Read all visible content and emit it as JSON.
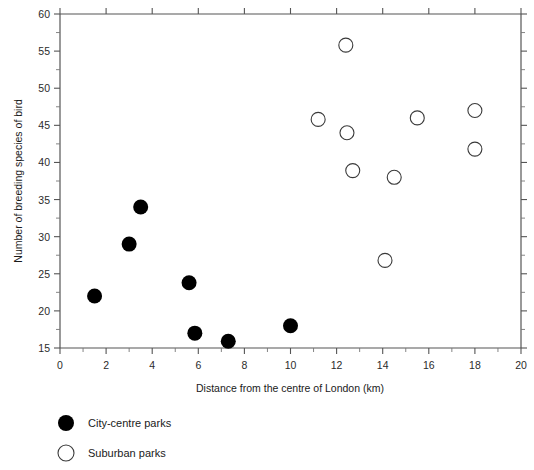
{
  "chart_data": {
    "type": "scatter",
    "title": "",
    "xlabel": "Distance from the centre of London (km)",
    "ylabel": "Number of breeding species of bird",
    "xlim": [
      0,
      20
    ],
    "ylim": [
      15,
      60
    ],
    "x_major_ticks": [
      0,
      2,
      4,
      6,
      8,
      10,
      12,
      14,
      16,
      18,
      20
    ],
    "x_tick_labels": [
      "0",
      "2",
      "4",
      "6",
      "8",
      "10",
      "12",
      "14",
      "16",
      "18",
      "20"
    ],
    "x_minor_step": 1,
    "y_major_ticks": [
      15,
      20,
      25,
      30,
      35,
      40,
      45,
      50,
      55,
      60
    ],
    "y_tick_labels": [
      "15",
      "20",
      "25",
      "30",
      "35",
      "40",
      "45",
      "50",
      "55",
      "60"
    ],
    "y_minor_step": 2.5,
    "grid": false,
    "legend_position": "below-left",
    "series": [
      {
        "name": "City-centre parks",
        "marker": "filled-circle",
        "color": "#000000",
        "points": [
          {
            "x": 1.5,
            "y": 22.0
          },
          {
            "x": 3.0,
            "y": 29.0
          },
          {
            "x": 3.5,
            "y": 34.0
          },
          {
            "x": 5.6,
            "y": 23.8
          },
          {
            "x": 5.85,
            "y": 17.0
          },
          {
            "x": 7.3,
            "y": 15.9
          },
          {
            "x": 10.0,
            "y": 18.0
          }
        ]
      },
      {
        "name": "Suburban parks",
        "marker": "open-circle",
        "color": "#ffffff",
        "points": [
          {
            "x": 11.2,
            "y": 45.8
          },
          {
            "x": 12.4,
            "y": 55.8
          },
          {
            "x": 12.45,
            "y": 44.0
          },
          {
            "x": 12.7,
            "y": 38.9
          },
          {
            "x": 14.1,
            "y": 26.8
          },
          {
            "x": 14.5,
            "y": 38.0
          },
          {
            "x": 15.5,
            "y": 46.0
          },
          {
            "x": 18.0,
            "y": 47.0
          },
          {
            "x": 18.0,
            "y": 41.8
          }
        ]
      }
    ]
  },
  "legend": {
    "entries": [
      {
        "label": "City-centre parks",
        "marker": "filled-circle"
      },
      {
        "label": "Suburban parks",
        "marker": "open-circle"
      }
    ]
  }
}
